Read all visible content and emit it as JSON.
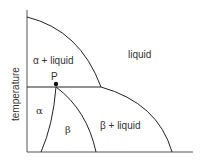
{
  "diagram": {
    "type": "phase-diagram",
    "y_axis_label": "temperature",
    "x_axis_label": "",
    "regions": {
      "alpha_liquid": "α + liquid",
      "liquid": "liquid",
      "alpha": "α",
      "beta": "β",
      "beta_liquid": "β + liquid"
    },
    "point_label": "P",
    "colors": {
      "line": "#222222",
      "text": "#333333",
      "background": "#ffffff"
    }
  }
}
